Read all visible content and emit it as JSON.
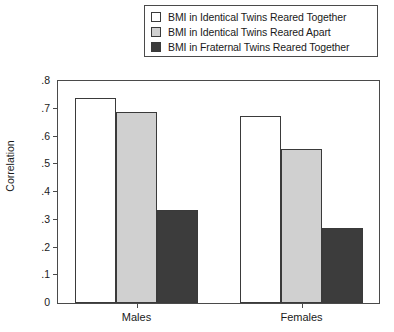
{
  "chart_data": {
    "type": "bar",
    "title": "",
    "xlabel": "",
    "ylabel": "Correlation",
    "categories": [
      "Males",
      "Females"
    ],
    "ylim": [
      0,
      0.8
    ],
    "yticks": [
      "0",
      ".1",
      ".2",
      ".3",
      ".4",
      ".5",
      ".6",
      ".7",
      ".8"
    ],
    "ytick_values": [
      0,
      0.1,
      0.2,
      0.3,
      0.4,
      0.5,
      0.6,
      0.7,
      0.8
    ],
    "grid": false,
    "legend_position": "top-right",
    "series": [
      {
        "name": "BMI in Identical Twins Reared Together",
        "color": "#ffffff",
        "values": [
          0.74,
          0.675
        ]
      },
      {
        "name": "BMI in Identical Twins Reared Apart",
        "color": "#d0d0d0",
        "values": [
          0.69,
          0.555
        ]
      },
      {
        "name": "BMI in Fraternal Twins Reared Together",
        "color": "#3c3c3c",
        "values": [
          0.335,
          0.27
        ]
      }
    ]
  },
  "legend": {
    "items": [
      {
        "label": "BMI in Identical Twins Reared Together",
        "color": "#ffffff"
      },
      {
        "label": "BMI in Identical Twins Reared Apart",
        "color": "#d0d0d0"
      },
      {
        "label": "BMI in Fraternal Twins Reared Together",
        "color": "#3c3c3c"
      }
    ]
  },
  "axes": {
    "y_title": "Correlation",
    "x_categories": [
      "Males",
      "Females"
    ]
  },
  "colors": {
    "border": "#4a4a4a",
    "bar_outline": "#3a3a3a",
    "series_1": "#ffffff",
    "series_2": "#d0d0d0",
    "series_3": "#3c3c3c"
  }
}
